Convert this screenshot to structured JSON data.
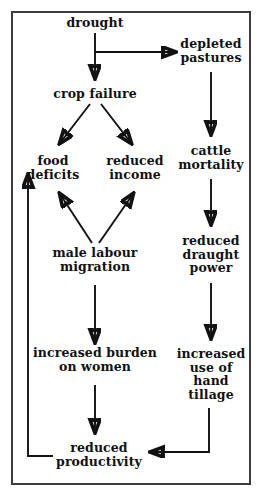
{
  "diagram": {
    "title_visible": false,
    "border_color": "#3c3c3c",
    "background_color": "#ffffff",
    "text_color": "#111111",
    "arrow_color": "#111111",
    "type": "flowchart",
    "nodes": [
      {
        "id": "drought",
        "label": "drought",
        "x": 95,
        "y": 22
      },
      {
        "id": "depleted-pastures",
        "label": "depleted\npastures",
        "x": 211,
        "y": 43
      },
      {
        "id": "crop-failure",
        "label": "crop failure",
        "x": 95,
        "y": 93
      },
      {
        "id": "food-deficits",
        "label": "food\ndeficits",
        "x": 53,
        "y": 160
      },
      {
        "id": "reduced-income",
        "label": "reduced\nincome",
        "x": 135,
        "y": 160
      },
      {
        "id": "cattle-mortality",
        "label": "cattle\nmortality",
        "x": 211,
        "y": 150
      },
      {
        "id": "male-labour-migration",
        "label": "male labour\nmigration",
        "x": 95,
        "y": 252
      },
      {
        "id": "reduced-draught-power",
        "label": "reduced\ndraught\npower",
        "x": 211,
        "y": 240
      },
      {
        "id": "increased-burden-on-women",
        "label": "increased burden\non women",
        "x": 95,
        "y": 357
      },
      {
        "id": "increased-use-of-hand-tillage",
        "label": "increased\nuse of\nhand\ntillage",
        "x": 211,
        "y": 353
      },
      {
        "id": "reduced-productivity",
        "label": "reduced\nproductivity",
        "x": 99,
        "y": 447
      }
    ],
    "edges": [
      {
        "from": "drought",
        "to": "crop-failure",
        "style": "straight-down"
      },
      {
        "from": "drought",
        "to": "depleted-pastures",
        "style": "branch-right"
      },
      {
        "from": "crop-failure",
        "to": "food-deficits",
        "style": "diagonal-down-left"
      },
      {
        "from": "crop-failure",
        "to": "reduced-income",
        "style": "diagonal-down-right"
      },
      {
        "from": "depleted-pastures",
        "to": "cattle-mortality",
        "style": "straight-down"
      },
      {
        "from": "cattle-mortality",
        "to": "reduced-draught-power",
        "style": "straight-down"
      },
      {
        "from": "male-labour-migration",
        "to": "food-deficits",
        "style": "diagonal-up-left"
      },
      {
        "from": "male-labour-migration",
        "to": "reduced-income",
        "style": "diagonal-up-right"
      },
      {
        "from": "male-labour-migration",
        "to": "increased-burden-on-women",
        "style": "straight-down"
      },
      {
        "from": "reduced-draught-power",
        "to": "increased-use-of-hand-tillage",
        "style": "straight-down"
      },
      {
        "from": "increased-burden-on-women",
        "to": "reduced-productivity",
        "style": "straight-down"
      },
      {
        "from": "increased-use-of-hand-tillage",
        "to": "reduced-productivity",
        "style": "elbow-down-left"
      },
      {
        "from": "reduced-productivity",
        "to": "food-deficits",
        "style": "elbow-left-up"
      }
    ]
  }
}
